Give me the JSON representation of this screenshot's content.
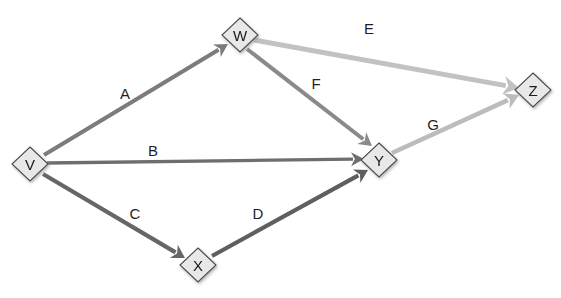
{
  "diagram": {
    "background_color": "#ffffff",
    "width": 561,
    "height": 298,
    "node_fill_color": "#e8e8e8",
    "node_stroke_color": "#4a4a4a",
    "node_label_color": "#1a1a1a",
    "edge_label_color": "#1f1f1f",
    "nodes": [
      {
        "id": "V",
        "label": "V",
        "cx": 30,
        "cy": 164,
        "rx": 18,
        "ry": 17
      },
      {
        "id": "W",
        "label": "W",
        "cx": 240,
        "cy": 35,
        "rx": 18,
        "ry": 17
      },
      {
        "id": "X",
        "label": "X",
        "cx": 198,
        "cy": 265,
        "rx": 18,
        "ry": 17
      },
      {
        "id": "Y",
        "label": "Y",
        "cx": 379,
        "cy": 160,
        "rx": 18,
        "ry": 17
      },
      {
        "id": "Z",
        "label": "Z",
        "cx": 533,
        "cy": 90,
        "rx": 18,
        "ry": 17
      }
    ],
    "edges": [
      {
        "id": "A",
        "label": "A",
        "from": "V",
        "to": "W",
        "color": "#7b7b7b",
        "width": 4.0,
        "x1": 44,
        "y1": 155,
        "x2": 228,
        "y2": 44,
        "label_x": 125,
        "label_y": 93
      },
      {
        "id": "B",
        "label": "B",
        "from": "V",
        "to": "Y",
        "color": "#6e6e6e",
        "width": 3.4,
        "x1": 47,
        "y1": 163,
        "x2": 364,
        "y2": 159,
        "label_x": 153,
        "label_y": 150
      },
      {
        "id": "C",
        "label": "C",
        "from": "V",
        "to": "X",
        "color": "#666666",
        "width": 4.2,
        "x1": 43,
        "y1": 174,
        "x2": 185,
        "y2": 258,
        "label_x": 135,
        "label_y": 213
      },
      {
        "id": "D",
        "label": "D",
        "from": "X",
        "to": "Y",
        "color": "#5e5e5e",
        "width": 4.2,
        "x1": 212,
        "y1": 256,
        "x2": 368,
        "y2": 170,
        "label_x": 258,
        "label_y": 213
      },
      {
        "id": "E",
        "label": "E",
        "from": "W",
        "to": "Z",
        "color": "#c2c2c2",
        "width": 5.0,
        "x1": 254,
        "y1": 40,
        "x2": 519,
        "y2": 88,
        "label_x": 369,
        "label_y": 28
      },
      {
        "id": "F",
        "label": "F",
        "from": "W",
        "to": "Y",
        "color": "#8a8a8a",
        "width": 4.0,
        "x1": 247,
        "y1": 49,
        "x2": 372,
        "y2": 146,
        "label_x": 316,
        "label_y": 83
      },
      {
        "id": "G",
        "label": "G",
        "from": "Y",
        "to": "Z",
        "color": "#bcbcbc",
        "width": 4.6,
        "x1": 392,
        "y1": 153,
        "x2": 519,
        "y2": 95,
        "label_x": 433,
        "label_y": 124
      }
    ]
  }
}
